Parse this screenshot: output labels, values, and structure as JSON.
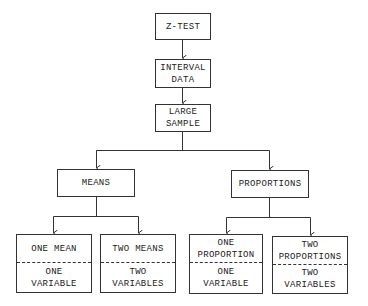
{
  "diagram": {
    "type": "flowchart",
    "nodes": {
      "z_test": {
        "label": "Z-TEST"
      },
      "interval": {
        "line1": "INTERVAL",
        "line2": "DATA"
      },
      "large": {
        "line1": "LARGE",
        "line2": "SAMPLE"
      },
      "means": {
        "label": "MEANS"
      },
      "proportions": {
        "label": "PROPORTIONS"
      },
      "one_mean": {
        "top": [
          "ONE MEAN"
        ],
        "bottom": [
          "ONE",
          "VARIABLE"
        ]
      },
      "two_means": {
        "top": [
          "TWO MEANS"
        ],
        "bottom": [
          "TWO",
          "VARIABLES"
        ]
      },
      "one_prop": {
        "top": [
          "ONE",
          "PROPORTION"
        ],
        "bottom": [
          "ONE",
          "VARIABLE"
        ]
      },
      "two_prop": {
        "top": [
          "TWO",
          "PROPORTIONS"
        ],
        "bottom": [
          "TWO",
          "VARIABLES"
        ]
      }
    },
    "edges": [
      [
        "Z-TEST",
        "INTERVAL DATA"
      ],
      [
        "INTERVAL DATA",
        "LARGE SAMPLE"
      ],
      [
        "LARGE SAMPLE",
        "MEANS"
      ],
      [
        "LARGE SAMPLE",
        "PROPORTIONS"
      ],
      [
        "MEANS",
        "ONE MEAN"
      ],
      [
        "MEANS",
        "TWO MEANS"
      ],
      [
        "PROPORTIONS",
        "ONE PROPORTION"
      ],
      [
        "PROPORTIONS",
        "TWO PROPORTIONS"
      ]
    ],
    "colors": {
      "line": "#333333",
      "background": "#ffffff"
    }
  }
}
